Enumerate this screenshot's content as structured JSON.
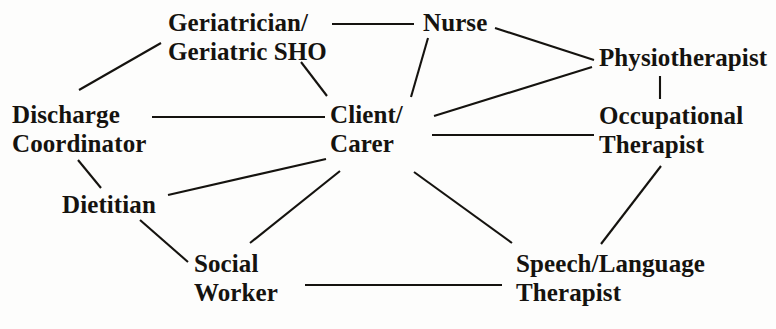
{
  "diagram": {
    "type": "network-diagram",
    "title": "",
    "canvas": {
      "width": 776,
      "height": 329
    },
    "ink_color": "#15130f",
    "background_color": "#fdfdfc",
    "nodes": [
      {
        "id": "geriatrician",
        "label_line1": "Geriatrician/",
        "label_line2": "Geriatric SHO",
        "x": 168,
        "y": 8,
        "align": "left"
      },
      {
        "id": "nurse",
        "label_line1": "Nurse",
        "label_line2": "",
        "x": 423,
        "y": 8,
        "align": "left"
      },
      {
        "id": "physiotherapist",
        "label_line1": "Physiotherapist",
        "label_line2": "",
        "x": 599,
        "y": 43,
        "align": "left"
      },
      {
        "id": "discharge-coordinator",
        "label_line1": "Discharge",
        "label_line2": "Coordinator",
        "x": 12,
        "y": 100,
        "align": "left"
      },
      {
        "id": "client-carer",
        "label_line1": "Client/",
        "label_line2": "Carer",
        "x": 330,
        "y": 100,
        "align": "left"
      },
      {
        "id": "occupational-therapist",
        "label_line1": "Occupational",
        "label_line2": "Therapist",
        "x": 599,
        "y": 101,
        "align": "left"
      },
      {
        "id": "dietitian",
        "label_line1": "Dietitian",
        "label_line2": "",
        "x": 62,
        "y": 190,
        "align": "left"
      },
      {
        "id": "social-worker",
        "label_line1": "Social",
        "label_line2": "Worker",
        "x": 194,
        "y": 249,
        "align": "left"
      },
      {
        "id": "speech-language-therapist",
        "label_line1": "Speech/Language",
        "label_line2": "Therapist",
        "x": 516,
        "y": 249,
        "align": "left"
      }
    ],
    "edges": [
      {
        "from": "geriatrician",
        "to": "nurse",
        "x1": 332,
        "y1": 24,
        "x2": 414,
        "y2": 24
      },
      {
        "from": "geriatrician",
        "to": "discharge-coordinator",
        "x1": 161,
        "y1": 43,
        "x2": 79,
        "y2": 90
      },
      {
        "from": "geriatrician",
        "to": "client-carer",
        "x1": 301,
        "y1": 62,
        "x2": 327,
        "y2": 96
      },
      {
        "from": "nurse",
        "to": "client-carer",
        "x1": 428,
        "y1": 38,
        "x2": 411,
        "y2": 97
      },
      {
        "from": "nurse",
        "to": "physiotherapist",
        "x1": 495,
        "y1": 28,
        "x2": 594,
        "y2": 60
      },
      {
        "from": "physiotherapist",
        "to": "occupational-therapist",
        "x1": 660,
        "y1": 76,
        "x2": 660,
        "y2": 99
      },
      {
        "from": "physiotherapist",
        "to": "client-carer",
        "x1": 592,
        "y1": 67,
        "x2": 434,
        "y2": 116
      },
      {
        "from": "discharge-coordinator",
        "to": "client-carer",
        "x1": 152,
        "y1": 117,
        "x2": 325,
        "y2": 117
      },
      {
        "from": "discharge-coordinator",
        "to": "dietitian",
        "x1": 78,
        "y1": 160,
        "x2": 101,
        "y2": 188
      },
      {
        "from": "client-carer",
        "to": "occupational-therapist",
        "x1": 432,
        "y1": 135,
        "x2": 594,
        "y2": 135
      },
      {
        "from": "client-carer",
        "to": "dietitian",
        "x1": 326,
        "y1": 159,
        "x2": 168,
        "y2": 195
      },
      {
        "from": "client-carer",
        "to": "social-worker",
        "x1": 340,
        "y1": 171,
        "x2": 250,
        "y2": 243
      },
      {
        "from": "client-carer",
        "to": "speech-language-therapist",
        "x1": 414,
        "y1": 172,
        "x2": 512,
        "y2": 243
      },
      {
        "from": "occupational-therapist",
        "to": "speech-language-therapist",
        "x1": 661,
        "y1": 166,
        "x2": 601,
        "y2": 244
      },
      {
        "from": "social-worker",
        "to": "speech-language-therapist",
        "x1": 305,
        "y1": 285,
        "x2": 502,
        "y2": 285
      },
      {
        "from": "dietitian",
        "to": "social-worker",
        "x1": 140,
        "y1": 220,
        "x2": 188,
        "y2": 262
      }
    ]
  }
}
